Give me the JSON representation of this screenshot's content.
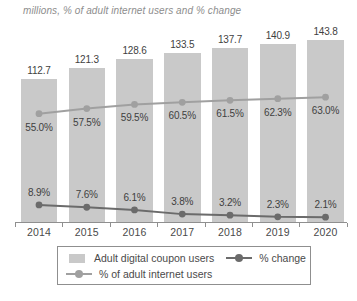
{
  "title": "millions, % of adult internet users and % change",
  "chart_data": {
    "type": "bar",
    "title": "millions, % of adult internet users and % change",
    "categories": [
      "2014",
      "2015",
      "2016",
      "2017",
      "2018",
      "2019",
      "2020"
    ],
    "series": [
      {
        "name": "Adult digital coupon users",
        "type": "bar",
        "unit": "millions",
        "values": [
          112.7,
          121.3,
          128.6,
          133.5,
          137.7,
          140.9,
          143.8
        ],
        "labels": [
          "112.7",
          "121.3",
          "128.6",
          "133.5",
          "137.7",
          "140.9",
          "143.8"
        ],
        "color": "#c9c9c9"
      },
      {
        "name": "% of adult internet users",
        "type": "line",
        "values": [
          55.0,
          57.5,
          59.5,
          60.5,
          61.5,
          62.3,
          63.0
        ],
        "labels": [
          "55.0%",
          "57.5%",
          "59.5%",
          "60.5%",
          "61.5%",
          "62.3%",
          "63.0%"
        ],
        "color": "#a0a0a0"
      },
      {
        "name": "% change",
        "type": "line",
        "values": [
          8.9,
          7.6,
          6.1,
          3.8,
          3.2,
          2.3,
          2.1
        ],
        "labels": [
          "8.9%",
          "7.6%",
          "6.1%",
          "3.8%",
          "3.2%",
          "2.3%",
          "2.1%"
        ],
        "color": "#6b6b6b"
      }
    ],
    "xlabel": "",
    "ylabel": "",
    "grid": false,
    "legend_position": "bottom"
  },
  "legend": {
    "rows": [
      [
        {
          "label": "Adult digital coupon users",
          "marker": "square",
          "color": "#c9c9c9"
        },
        {
          "label": "% change",
          "marker": "line-dot",
          "color": "#6b6b6b"
        }
      ],
      [
        {
          "label": "% of adult internet users",
          "marker": "line-dot",
          "color": "#a0a0a0"
        }
      ]
    ]
  },
  "colors": {
    "bar": "#c9c9c9",
    "internet_users_line": "#a0a0a0",
    "pct_change_line": "#6b6b6b",
    "axis": "#8f8f8f",
    "value_text": "#3f3f3f",
    "title_text": "#8d8d8d"
  }
}
